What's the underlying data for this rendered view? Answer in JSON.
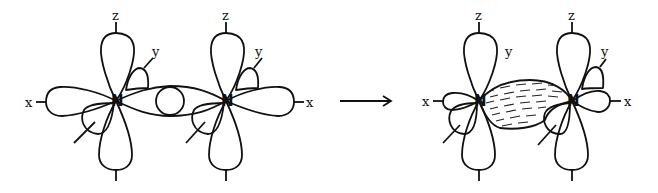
{
  "diagram": {
    "type": "orbital-overlap",
    "before": {
      "atoms": [
        {
          "symbol": "N",
          "axes": {
            "x": "x",
            "y": "y",
            "z": "z"
          }
        },
        {
          "symbol": "N",
          "axes": {
            "x": "x",
            "y": "y",
            "z": "z"
          }
        }
      ]
    },
    "arrow": "→",
    "after": {
      "atoms": [
        {
          "symbol": "N",
          "axes": {
            "x": "x",
            "y": "y",
            "z": "z"
          }
        },
        {
          "symbol": "N",
          "axes": {
            "x": "x",
            "y": "y",
            "z": "z"
          }
        }
      ],
      "bond": "shaded sigma overlap region"
    }
  },
  "labels": {
    "n1": "N",
    "n2": "N",
    "n3": "N",
    "n4": "N",
    "x1": "x",
    "z1": "z",
    "y1": "y",
    "x2": "x",
    "z2": "z",
    "y2": "y",
    "x3": "x",
    "z3": "z",
    "y3": "y",
    "x4": "x",
    "z4": "z",
    "y4": "y"
  }
}
